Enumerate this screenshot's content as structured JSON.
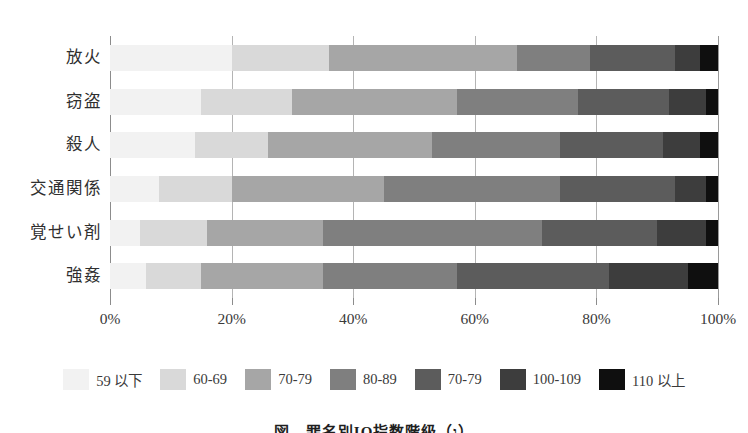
{
  "chart_data": {
    "type": "bar",
    "orientation": "horizontal",
    "stacked": true,
    "normalized_percent": true,
    "title": "",
    "caption": "図　罪名別IQ指数階級（ו）",
    "xlabel": "",
    "ylabel": "",
    "xlim": [
      0,
      100
    ],
    "grid": true,
    "legend_position": "bottom",
    "xticks": [
      0,
      20,
      40,
      60,
      80,
      100
    ],
    "xticklabels": [
      "0%",
      "20%",
      "40%",
      "60%",
      "80%",
      "100%"
    ],
    "categories": [
      "放火",
      "窃盗",
      "殺人",
      "交通関係",
      "覚せい剤",
      "強姦"
    ],
    "series": [
      {
        "name": "59 以下",
        "color": "#f2f2f2",
        "values": [
          20.0,
          15.0,
          14.0,
          8.0,
          5.0,
          6.0
        ]
      },
      {
        "name": "60-69",
        "color": "#d9d9d9",
        "values": [
          16.0,
          15.0,
          12.0,
          12.0,
          11.0,
          9.0
        ]
      },
      {
        "name": "70-79",
        "color": "#a6a6a6",
        "values": [
          31.0,
          27.0,
          27.0,
          25.0,
          19.0,
          20.0
        ]
      },
      {
        "name": "80-89",
        "color": "#7f7f7f",
        "values": [
          12.0,
          20.0,
          21.0,
          29.0,
          36.0,
          22.0
        ]
      },
      {
        "name": "70-79",
        "color": "#5c5c5c",
        "values": [
          14.0,
          15.0,
          17.0,
          19.0,
          19.0,
          25.0
        ]
      },
      {
        "name": "100-109",
        "color": "#3d3d3d",
        "values": [
          4.0,
          6.0,
          6.0,
          5.0,
          8.0,
          13.0
        ]
      },
      {
        "name": "110 以上",
        "color": "#0f0f0f",
        "values": [
          3.0,
          2.0,
          3.0,
          2.0,
          2.0,
          5.0
        ]
      }
    ]
  },
  "axis": {
    "tick_color": "#8c8c8c",
    "grid_color": "#b4b4b4"
  }
}
